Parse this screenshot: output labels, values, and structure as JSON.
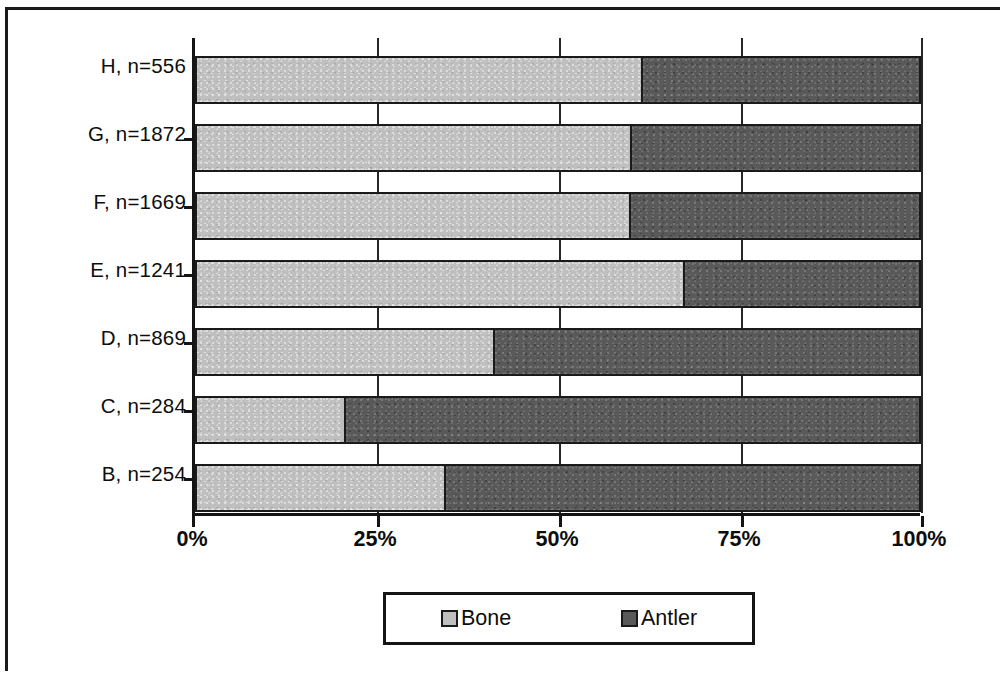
{
  "chart_data": {
    "type": "bar",
    "orientation": "horizontal",
    "stacked": true,
    "normalized_percent": true,
    "title": "",
    "subtitle": "",
    "xlabel": "",
    "ylabel": "",
    "xlim": [
      0,
      100
    ],
    "xticks": [
      0,
      25,
      50,
      75,
      100
    ],
    "xticklabels": [
      "0%",
      "25%",
      "50%",
      "75%",
      "100%"
    ],
    "grid": true,
    "grid_axis": "x",
    "legend_position": "bottom",
    "categories": [
      "B, n=254",
      "C, n=284",
      "D, n=869",
      "E, n=1241",
      "F, n=1669",
      "G, n=1872",
      "H, n=556"
    ],
    "category_order_top_to_bottom": [
      "H, n=556",
      "G, n=1872",
      "F, n=1669",
      "E, n=1241",
      "D, n=869",
      "C, n=284",
      "B, n=254"
    ],
    "series": [
      {
        "name": "Bone",
        "color": "#bfbfbf",
        "values": [
          34.5,
          20.7,
          41.2,
          67.3,
          59.9,
          60.0,
          61.5
        ]
      },
      {
        "name": "Antler",
        "color": "#595959",
        "values": [
          65.5,
          79.3,
          58.8,
          32.7,
          40.1,
          40.0,
          38.5
        ]
      }
    ],
    "rows_top_to_bottom": [
      {
        "label": "H, n=556",
        "bone": 61.5,
        "antler": 38.5
      },
      {
        "label": "G, n=1872",
        "bone": 60.0,
        "antler": 40.0
      },
      {
        "label": "F, n=1669",
        "bone": 59.9,
        "antler": 40.1
      },
      {
        "label": "E, n=1241",
        "bone": 67.3,
        "antler": 32.7
      },
      {
        "label": "D, n=869",
        "bone": 41.2,
        "antler": 58.8
      },
      {
        "label": "C, n=284",
        "bone": 20.7,
        "antler": 79.3
      },
      {
        "label": "B, n=254",
        "bone": 34.5,
        "antler": 65.5
      }
    ]
  },
  "legend": {
    "entries": [
      {
        "label": "Bone",
        "swatch": "bone-swatch"
      },
      {
        "label": "Antler",
        "swatch": "antler-swatch"
      }
    ]
  },
  "axis": {
    "xticklabels": [
      "0%",
      "25%",
      "50%",
      "75%",
      "100%"
    ]
  },
  "colors": {
    "bone": "#bfbfbf",
    "antler": "#595959",
    "axis": "#141414",
    "frame": "#1a1a1a",
    "background": "#ffffff"
  }
}
